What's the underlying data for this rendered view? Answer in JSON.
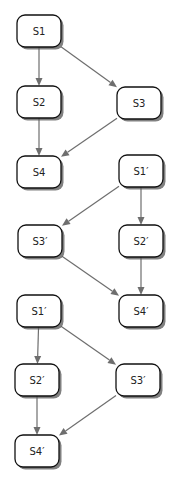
{
  "diagram": {
    "type": "flow-graphs",
    "colors": {
      "node_border": "#111111",
      "node_fill": "#ffffff",
      "edge": "#6e6e6e",
      "shadow": "#555555"
    },
    "graphs": [
      {
        "id": "graph-1",
        "nodes": [
          {
            "id": "g1-s1",
            "label": "S1"
          },
          {
            "id": "g1-s2",
            "label": "S2"
          },
          {
            "id": "g1-s3",
            "label": "S3"
          },
          {
            "id": "g1-s4",
            "label": "S4"
          }
        ],
        "edges": [
          {
            "from": "g1-s1",
            "to": "g1-s2"
          },
          {
            "from": "g1-s1",
            "to": "g1-s3"
          },
          {
            "from": "g1-s2",
            "to": "g1-s4"
          },
          {
            "from": "g1-s3",
            "to": "g1-s4"
          }
        ]
      },
      {
        "id": "graph-2",
        "nodes": [
          {
            "id": "g2-s1",
            "label": "S1′"
          },
          {
            "id": "g2-s3",
            "label": "S3′"
          },
          {
            "id": "g2-s2",
            "label": "S2′"
          },
          {
            "id": "g2-s4",
            "label": "S4′"
          }
        ],
        "edges": [
          {
            "from": "g2-s1",
            "to": "g2-s3"
          },
          {
            "from": "g2-s1",
            "to": "g2-s2"
          },
          {
            "from": "g2-s3",
            "to": "g2-s4"
          },
          {
            "from": "g2-s2",
            "to": "g2-s4"
          }
        ]
      },
      {
        "id": "graph-3",
        "nodes": [
          {
            "id": "g3-s1",
            "label": "S1′"
          },
          {
            "id": "g3-s2",
            "label": "S2′"
          },
          {
            "id": "g3-s3",
            "label": "S3′"
          },
          {
            "id": "g3-s4",
            "label": "S4′"
          }
        ],
        "edges": [
          {
            "from": "g3-s1",
            "to": "g3-s2"
          },
          {
            "from": "g3-s1",
            "to": "g3-s3"
          },
          {
            "from": "g3-s2",
            "to": "g3-s4"
          },
          {
            "from": "g3-s3",
            "to": "g3-s4"
          }
        ]
      }
    ]
  }
}
